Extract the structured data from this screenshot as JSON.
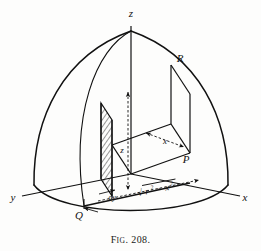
{
  "figure": {
    "caption_prefix": "F",
    "caption_small": "IG",
    "caption_rest": ". 208.",
    "caption_full": "FIG. 208."
  },
  "axes": {
    "z_label": "z",
    "x_label": "x",
    "y_label": "y"
  },
  "points": {
    "R": "R",
    "P": "P",
    "Q": "Q"
  },
  "dimensions": {
    "height_label": "z",
    "depth_label": "x",
    "thickness_label": "dy",
    "thickness_label_2": "dy",
    "radical_sqrt": "√",
    "radical_r": "r",
    "radical_r_exp": "2",
    "radical_minus": "−",
    "radical_x": "x",
    "radical_x_exp": "2",
    "radical_full": "√(r² − x²)"
  },
  "colors": {
    "ink": "#111111",
    "paper": "#fdfdfc",
    "hatch": "#1a1a1a"
  }
}
